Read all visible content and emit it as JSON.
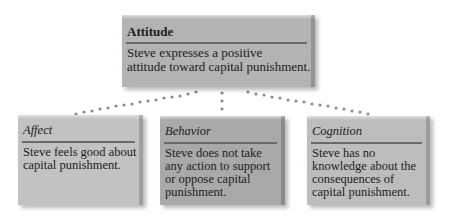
{
  "diagram": {
    "root": {
      "title": "Attitude",
      "text": "Steve expresses a positive\nattitude toward capital punishment."
    },
    "components": [
      {
        "title": "Affect",
        "text": "Steve feels good about\ncapital punishment."
      },
      {
        "title": "Behavior",
        "text": "Steve does not take\nany action to support\nor oppose capital\npunishment."
      },
      {
        "title": "Cognition",
        "text": "Steve has no\nknowledge about the\nconsequences of\ncapital punishment."
      }
    ],
    "colors": {
      "root_box": "#b3b3b3",
      "affect_box": "#c2c2c2",
      "behavior_box": "#a9a9a9",
      "cognition_box": "#bdbdbd",
      "connector_dots": "#8c8c8c"
    }
  }
}
